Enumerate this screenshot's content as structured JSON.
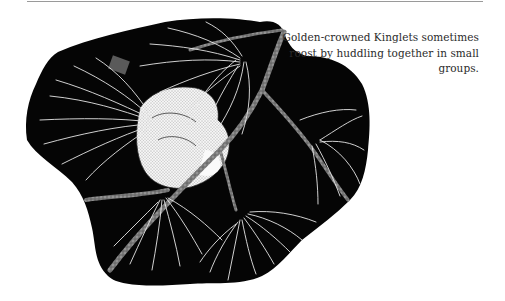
{
  "page": {
    "rule_color": "#9a9a9a",
    "background": "#ffffff"
  },
  "figure": {
    "silhouette_color": "#050505",
    "needle_color": "#e6e6e6",
    "bird_color": "#f2f2f2",
    "branch_color": "#8a8a8a"
  },
  "caption": {
    "text": "Golden-crowned Kinglets sometimes roost by huddling together in small groups."
  }
}
